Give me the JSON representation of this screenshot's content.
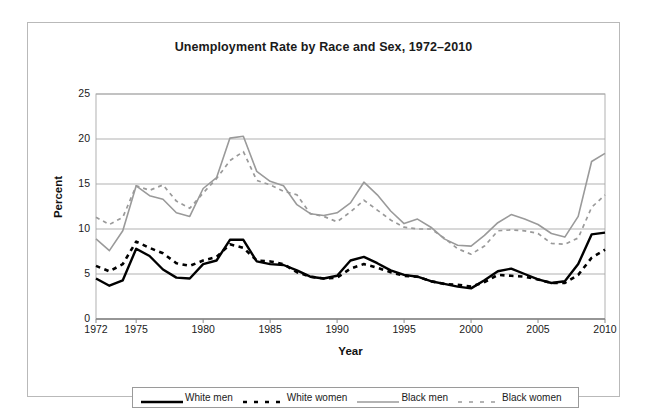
{
  "chart_data": {
    "type": "line",
    "title": "Unemployment Rate by Race and Sex, 1972–2010",
    "xlabel": "Year",
    "ylabel": "Percent",
    "xlim": [
      1972,
      2010
    ],
    "ylim": [
      0,
      25
    ],
    "grid": "horizontal",
    "legend_position": "bottom",
    "y_ticks": [
      25,
      20,
      15,
      10,
      5,
      0
    ],
    "x_ticks": [
      1972,
      1975,
      1980,
      1985,
      1990,
      1995,
      2000,
      2005,
      2010
    ],
    "x": [
      1972,
      1973,
      1974,
      1975,
      1976,
      1977,
      1978,
      1979,
      1980,
      1981,
      1982,
      1983,
      1984,
      1985,
      1986,
      1987,
      1988,
      1989,
      1990,
      1991,
      1992,
      1993,
      1994,
      1995,
      1996,
      1997,
      1998,
      1999,
      2000,
      2001,
      2002,
      2003,
      2004,
      2005,
      2006,
      2007,
      2008,
      2009,
      2010
    ],
    "series": [
      {
        "name": "White men",
        "color": "#000000",
        "style": "solid",
        "values": [
          4.5,
          3.7,
          4.3,
          7.8,
          7.0,
          5.5,
          4.6,
          4.5,
          6.1,
          6.5,
          8.8,
          8.8,
          6.4,
          6.1,
          6.0,
          5.4,
          4.7,
          4.5,
          4.8,
          6.5,
          6.9,
          6.2,
          5.4,
          4.9,
          4.7,
          4.2,
          3.9,
          3.6,
          3.4,
          4.3,
          5.3,
          5.6,
          5.0,
          4.4,
          4.0,
          4.2,
          6.1,
          9.4,
          9.6
        ]
      },
      {
        "name": "White women",
        "color": "#000000",
        "style": "dashed",
        "values": [
          5.9,
          5.3,
          6.1,
          8.6,
          7.9,
          7.3,
          6.2,
          5.9,
          6.5,
          6.9,
          8.3,
          7.9,
          6.5,
          6.4,
          6.1,
          5.2,
          4.7,
          4.5,
          4.6,
          5.6,
          6.1,
          5.7,
          5.2,
          4.8,
          4.7,
          4.2,
          3.9,
          3.8,
          3.6,
          4.1,
          4.9,
          4.8,
          4.7,
          4.4,
          4.0,
          4.0,
          4.9,
          6.8,
          7.7
        ]
      },
      {
        "name": "Black men",
        "color": "#9a9a9a",
        "style": "solid",
        "values": [
          8.9,
          7.6,
          9.8,
          14.8,
          13.7,
          13.3,
          11.8,
          11.4,
          14.5,
          15.7,
          20.1,
          20.3,
          16.4,
          15.3,
          14.8,
          12.7,
          11.7,
          11.5,
          11.8,
          12.9,
          15.2,
          13.8,
          12.0,
          10.6,
          11.1,
          10.2,
          8.9,
          8.2,
          8.1,
          9.3,
          10.7,
          11.6,
          11.1,
          10.5,
          9.5,
          9.1,
          11.4,
          17.5,
          18.4
        ]
      },
      {
        "name": "Black women",
        "color": "#9a9a9a",
        "style": "dashed",
        "values": [
          11.3,
          10.5,
          11.3,
          14.8,
          14.3,
          14.9,
          13.1,
          12.3,
          14.0,
          15.6,
          17.6,
          18.6,
          15.4,
          14.9,
          14.2,
          13.8,
          11.7,
          11.4,
          10.8,
          11.9,
          13.2,
          12.1,
          11.0,
          10.2,
          10.0,
          10.0,
          9.0,
          7.8,
          7.2,
          8.1,
          9.8,
          9.9,
          9.8,
          9.5,
          8.4,
          8.3,
          9.0,
          12.4,
          13.8
        ]
      }
    ]
  },
  "legend": {
    "items": [
      {
        "label": "White men"
      },
      {
        "label": "White women"
      },
      {
        "label": "Black men"
      },
      {
        "label": "Black women"
      }
    ]
  }
}
